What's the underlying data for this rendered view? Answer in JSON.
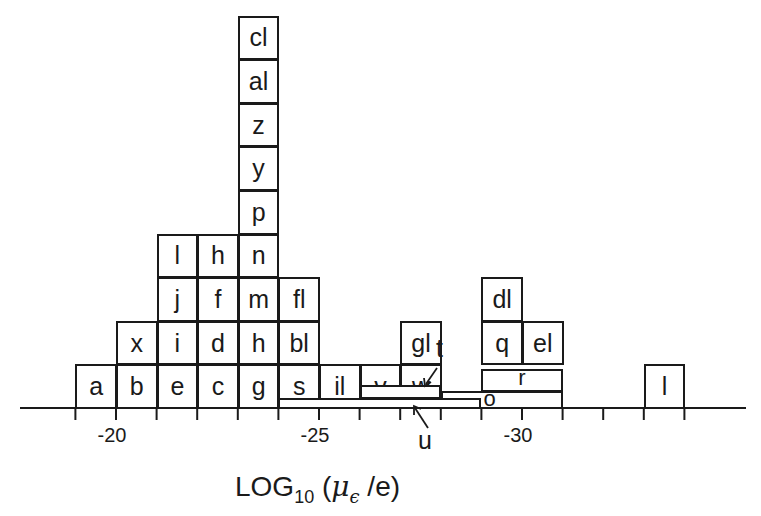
{
  "chart_data": {
    "type": "histogram-stacked-boxes",
    "title": "",
    "xlabel": "LOG10 (μϵ /e)",
    "xlabel_parts": {
      "main": "LOG",
      "sub": "10",
      "open": " (",
      "mu": "μ",
      "mu_sub": "ϵ",
      "rest": " /e)"
    },
    "ylabel": "",
    "x_axis": {
      "range": [
        -18.5,
        -33.0
      ],
      "direction": "decreasing-right",
      "tick_step": 1,
      "tick_labels": [
        {
          "value": -20,
          "label": "-20"
        },
        {
          "value": -25,
          "label": "-25"
        },
        {
          "value": -30,
          "label": "-30"
        }
      ],
      "grid": false
    },
    "boxes": [
      {
        "label": "a",
        "bin": -19.5,
        "level": 0
      },
      {
        "label": "b",
        "bin": -20.5,
        "level": 0
      },
      {
        "label": "x",
        "bin": -20.5,
        "level": 1
      },
      {
        "label": "e",
        "bin": -21.5,
        "level": 0
      },
      {
        "label": "i",
        "bin": -21.5,
        "level": 1
      },
      {
        "label": "j",
        "bin": -21.5,
        "level": 2
      },
      {
        "label": "l",
        "bin": -21.5,
        "level": 3
      },
      {
        "label": "c",
        "bin": -22.5,
        "level": 0
      },
      {
        "label": "d",
        "bin": -22.5,
        "level": 1
      },
      {
        "label": "f",
        "bin": -22.5,
        "level": 2
      },
      {
        "label": "h",
        "bin": -22.5,
        "level": 3
      },
      {
        "label": "g",
        "bin": -23.5,
        "level": 0
      },
      {
        "label": "h",
        "bin": -23.5,
        "level": 1
      },
      {
        "label": "m",
        "bin": -23.5,
        "level": 2
      },
      {
        "label": "n",
        "bin": -23.5,
        "level": 3
      },
      {
        "label": "p",
        "bin": -23.5,
        "level": 4
      },
      {
        "label": "y",
        "bin": -23.5,
        "level": 5
      },
      {
        "label": "z",
        "bin": -23.5,
        "level": 6
      },
      {
        "label": "al",
        "bin": -23.5,
        "level": 7
      },
      {
        "label": "cl",
        "bin": -23.5,
        "level": 8
      },
      {
        "label": "s",
        "bin": -24.5,
        "level": 0
      },
      {
        "label": "bl",
        "bin": -24.5,
        "level": 1
      },
      {
        "label": "fl",
        "bin": -24.5,
        "level": 2
      },
      {
        "label": "il",
        "bin": -25.5,
        "level": 0
      },
      {
        "label": "v",
        "bin": -26.5,
        "level": 0
      },
      {
        "label": "w",
        "bin": -27.5,
        "level": 0
      },
      {
        "label": "gl",
        "bin": -27.5,
        "level": 1
      },
      {
        "label": "q",
        "bin": -29.5,
        "level": 1
      },
      {
        "label": "dl",
        "bin": -29.5,
        "level": 2
      },
      {
        "label": "el",
        "bin": -30.5,
        "level": 1
      },
      {
        "label": "l",
        "bin": -33.5,
        "level": 0
      }
    ],
    "range_bars": [
      {
        "label": "u",
        "from": -24.0,
        "to": -29.0,
        "note": "thin bar, label below axis with arrow"
      },
      {
        "label": "t",
        "from": -26.0,
        "to": -28.0,
        "note": "label above with arrow"
      },
      {
        "label": "o",
        "from": -28.0,
        "to": -31.0
      },
      {
        "label": "r",
        "from": -29.0,
        "to": -31.0
      }
    ],
    "counts_per_bin": {
      "-19.5": 1,
      "-20.5": 2,
      "-21.5": 4,
      "-22.5": 4,
      "-23.5": 9,
      "-24.5": 3,
      "-25.5": 1,
      "-26.5": 1,
      "-27.5": 2,
      "-29.5": 2,
      "-30.5": 1,
      "-33.5": 1
    }
  }
}
